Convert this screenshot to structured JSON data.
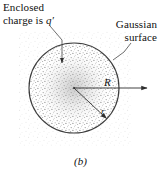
{
  "figure": {
    "caption": "(b)",
    "labels": {
      "enclosed_charge_line1": "Enclosed",
      "enclosed_charge_line2": "charge is",
      "enclosed_charge_symbol": "q′",
      "gaussian_surface": "Gaussian surface",
      "radius_outer": "R",
      "radius_inner": "r"
    },
    "colors": {
      "ink": "#101010",
      "line": "#3a3a3a",
      "stipple": "#9a9a9a",
      "background": "#ffffff"
    },
    "geometry": {
      "circle_center_x": 74,
      "circle_center_y": 88,
      "circle_radius": 45,
      "arrow_R_end_x": 150,
      "arrow_r_end_x": 110,
      "arrow_r_end_y": 120
    }
  }
}
